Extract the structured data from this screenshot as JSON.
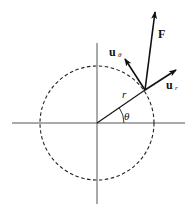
{
  "diagram": {
    "labels": {
      "force": "F",
      "u_theta_base": "u",
      "u_theta_sub": "θ",
      "u_r_base": "u",
      "u_r_sub": "r",
      "radius": "r",
      "angle": "θ"
    },
    "elements": [
      {
        "name": "horizontal-axis",
        "type": "line"
      },
      {
        "name": "vertical-axis",
        "type": "line"
      },
      {
        "name": "dashed-circle",
        "type": "circle",
        "style": "dashed"
      },
      {
        "name": "radius-line",
        "label": "r"
      },
      {
        "name": "angle-arc",
        "label": "θ"
      },
      {
        "name": "force-vector",
        "label": "F"
      },
      {
        "name": "radial-unit-vector",
        "label": "u_r"
      },
      {
        "name": "transverse-unit-vector",
        "label": "u_θ"
      }
    ],
    "colors": {
      "ink": "#111111",
      "axis": "#555555",
      "background": "#ffffff"
    }
  }
}
